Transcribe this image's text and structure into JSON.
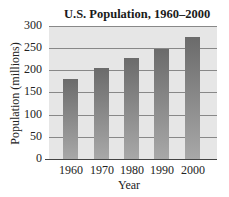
{
  "chart_data": {
    "type": "bar",
    "title": "U.S. Population, 1960–2000",
    "xlabel": "Year",
    "ylabel": "Population (millions)",
    "categories": [
      "1960",
      "1970",
      "1980",
      "1990",
      "2000"
    ],
    "values": [
      180,
      205,
      227,
      249,
      275
    ],
    "ylim": [
      0,
      300
    ],
    "yticks": [
      "0",
      "50",
      "100",
      "150",
      "200",
      "250",
      "300"
    ],
    "grid": true,
    "legend": null
  }
}
